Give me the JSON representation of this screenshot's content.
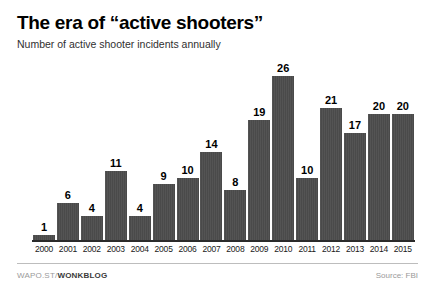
{
  "header": {
    "title": "The era of “active shooters”",
    "subtitle": "Number of active shooter incidents annually"
  },
  "footer": {
    "credit_prefix": "WAPO.ST/",
    "credit_brand": "WONKBLOG",
    "source": "Source: FBI"
  },
  "style": {
    "bar_color": "#4a4a4a",
    "axis_color": "#2b2b2b",
    "title_color": "#000000",
    "subtitle_color": "#2f2f2f",
    "footer_muted_color": "#9a9a9a",
    "background": "#ffffff"
  },
  "chart_data": {
    "type": "bar",
    "title": "The era of “active shooters”",
    "subtitle": "Number of active shooter incidents annually",
    "xlabel": "",
    "ylabel": "",
    "ylim": [
      0,
      26
    ],
    "grid": false,
    "legend": false,
    "source": "Source: FBI",
    "data_labels": true,
    "categories": [
      "2000",
      "2001",
      "2002",
      "2003",
      "2004",
      "2005",
      "2006",
      "2007",
      "2008",
      "2009",
      "2010",
      "2011",
      "2012",
      "2013",
      "2014",
      "2015"
    ],
    "values": [
      1,
      6,
      4,
      11,
      4,
      9,
      10,
      14,
      8,
      19,
      26,
      10,
      21,
      17,
      20,
      20
    ]
  }
}
